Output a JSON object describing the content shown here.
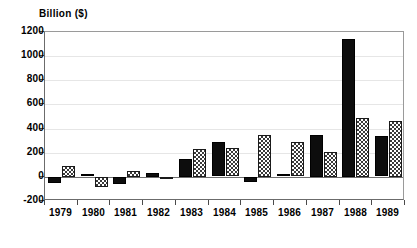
{
  "chart_data": {
    "type": "bar",
    "title": "",
    "subtitle": "",
    "xlabel": "",
    "ylabel": "Billion ($)",
    "categories": [
      "1979",
      "1980",
      "1981",
      "1982",
      "1983",
      "1984",
      "1985",
      "1986",
      "1987",
      "1988",
      "1989"
    ],
    "series": [
      {
        "name": "series-1",
        "style": "solid-black",
        "color": "#0d0d0d",
        "values": [
          -50,
          20,
          -60,
          30,
          145,
          285,
          -40,
          20,
          345,
          1140,
          335
        ]
      },
      {
        "name": "series-2",
        "style": "checkered-hatch",
        "color": "#3a3a3a",
        "values": [
          90,
          -80,
          50,
          -15,
          230,
          235,
          350,
          285,
          210,
          485,
          460
        ]
      }
    ],
    "ylim": [
      -200,
      1200
    ],
    "yticks": [
      -200,
      0,
      200,
      400,
      600,
      800,
      1000,
      1200
    ],
    "ytick_labels": [
      "-200",
      "0",
      "200",
      "400",
      "600",
      "800",
      "1000",
      "1200"
    ],
    "grid": true,
    "grid_axis": "y",
    "legend": "none",
    "legend_position": "none"
  }
}
